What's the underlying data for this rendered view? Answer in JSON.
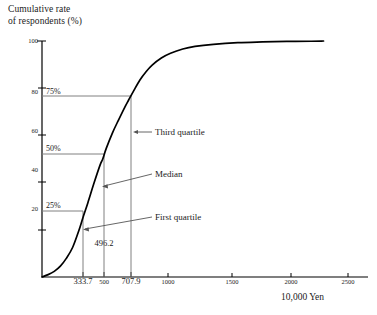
{
  "chart_data": {
    "type": "line",
    "title": "",
    "ylabel": "Cumulative rate\nof respondents (%)",
    "xlabel": "10,000 Yen",
    "xlim": [
      0,
      2600
    ],
    "ylim": [
      0,
      100
    ],
    "grid": false,
    "legend": null,
    "y_ticks": [
      20,
      40,
      60,
      80,
      100
    ],
    "y_tick_labels": [
      "20",
      "40",
      "60",
      "80",
      "100"
    ],
    "x_ticks": [
      333.7,
      500,
      707.9,
      1000,
      1500,
      2000,
      2500
    ],
    "x_tick_labels": [
      "333.7",
      "500",
      "707.9",
      "1000",
      "1500",
      "2000",
      "2500"
    ],
    "series": [
      {
        "name": "Cumulative rate of respondents",
        "x": [
          0,
          50,
          100,
          150,
          200,
          250,
          300,
          333.7,
          375,
          425,
          475,
          496.2,
          525,
          575,
          625,
          675,
          707.9,
          750,
          800,
          850,
          900,
          975,
          1050,
          1150,
          1250,
          1400,
          1600,
          1800,
          2000,
          2200,
          2300
        ],
        "y": [
          0,
          1.0,
          2.4,
          4.6,
          8.0,
          12.5,
          19.5,
          25.0,
          31.5,
          39.8,
          47.5,
          50.0,
          54.5,
          61.0,
          66.5,
          71.8,
          75.0,
          79.0,
          83.5,
          87.0,
          89.8,
          92.8,
          94.8,
          96.6,
          97.7,
          98.6,
          99.3,
          99.6,
          99.8,
          99.9,
          100.0
        ]
      }
    ],
    "annotations": [
      {
        "name": "first-quartile",
        "label": "First quartile",
        "percent": "25%",
        "value": 333.7,
        "y": 25
      },
      {
        "name": "median",
        "label": "Median",
        "percent": "50%",
        "value": 496.2,
        "y": 50,
        "value_label": "496.2"
      },
      {
        "name": "third-quartile",
        "label": "Third quartile",
        "percent": "75%",
        "value": 707.9,
        "y": 75
      }
    ],
    "colors": {
      "curve": "#000000",
      "axis": "#000000",
      "guide": "#808080",
      "leader": "#6b6b6b",
      "text": "#1a1a1a"
    }
  },
  "labels": {
    "y_axis_title": "Cumulative rate\nof respondents (%)",
    "x_axis_title": "10,000 Yen",
    "pct_25": "25%",
    "pct_50": "50%",
    "pct_75": "75%",
    "ann_first": "First quartile",
    "ann_median": "Median",
    "ann_third": "Third quartile",
    "median_value": "496.2",
    "y0": "20",
    "y1": "40",
    "y2": "60",
    "y3": "80",
    "y4": "100",
    "x0": "333.7",
    "x1": "500",
    "x2": "707.9",
    "x3": "1000",
    "x4": "1500",
    "x5": "2000",
    "x6": "2500"
  }
}
